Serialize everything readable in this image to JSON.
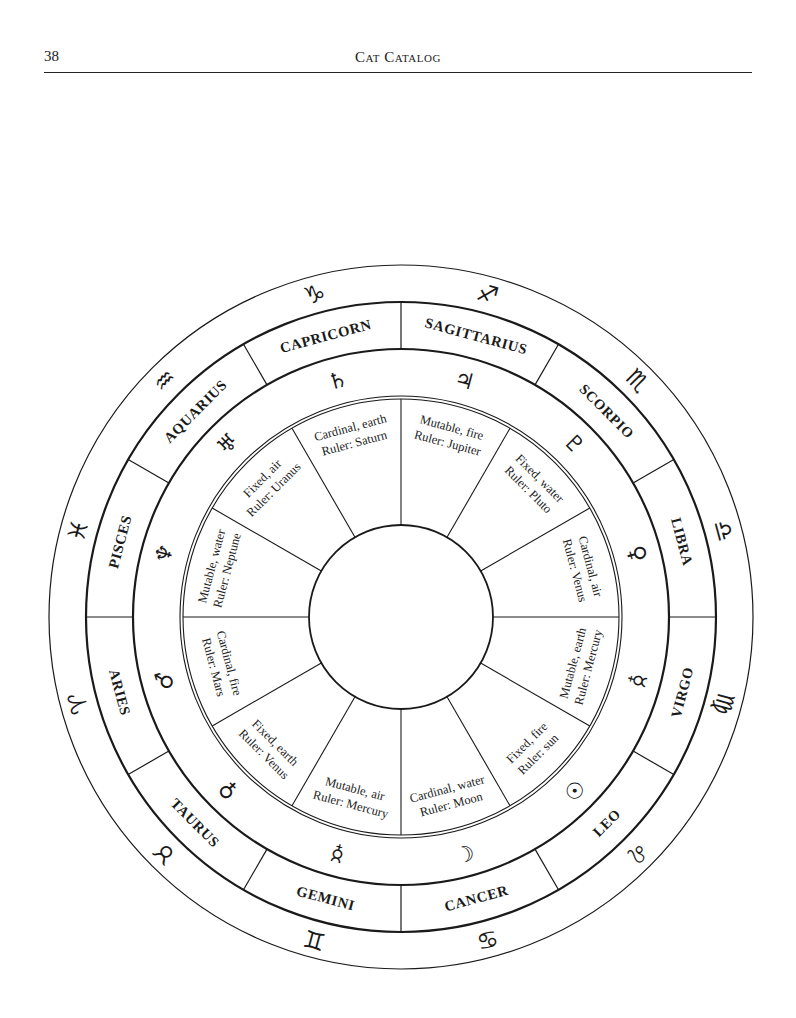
{
  "header": {
    "page_number": "38",
    "running_head": "Cat Catalog"
  },
  "wheel": {
    "center": [
      401,
      617
    ],
    "radii": {
      "outer": 352,
      "sign_band_outer": 315,
      "sign_band_inner": 268,
      "double_outer": 221,
      "double_inner": 218,
      "hub": 92
    },
    "line_color": "#1a1a1a",
    "segments": [
      {
        "sign": "SAGITTARIUS",
        "sign_glyph": "♐",
        "sign_glyph_name": "sagittarius-glyph-icon",
        "planet_glyph": "♃",
        "planet_glyph_name": "jupiter-glyph-icon",
        "quality": "Mutable, fire",
        "ruler": "Ruler: Jupiter",
        "angle": 15
      },
      {
        "sign": "SCORPIO",
        "sign_glyph": "♏",
        "sign_glyph_name": "scorpio-glyph-icon",
        "planet_glyph": "♇",
        "planet_glyph_name": "pluto-glyph-icon",
        "quality": "Fixed, water",
        "ruler": "Ruler: Pluto",
        "angle": 45
      },
      {
        "sign": "LIBRA",
        "sign_glyph": "♎",
        "sign_glyph_name": "libra-glyph-icon",
        "planet_glyph": "♀",
        "planet_glyph_name": "venus-glyph-icon",
        "quality": "Cardinal, air",
        "ruler": "Ruler: Venus",
        "angle": 75
      },
      {
        "sign": "VIRGO",
        "sign_glyph": "♍",
        "sign_glyph_name": "virgo-glyph-icon",
        "planet_glyph": "☿",
        "planet_glyph_name": "mercury-glyph-icon",
        "quality": "Mutable, earth",
        "ruler": "Ruler: Mercury",
        "angle": 105
      },
      {
        "sign": "LEO",
        "sign_glyph": "♌",
        "sign_glyph_name": "leo-glyph-icon",
        "planet_glyph": "☉",
        "planet_glyph_name": "sun-glyph-icon",
        "quality": "Fixed, fire",
        "ruler": "Ruler: sun",
        "angle": 135
      },
      {
        "sign": "CANCER",
        "sign_glyph": "♋",
        "sign_glyph_name": "cancer-glyph-icon",
        "planet_glyph": "☾",
        "planet_glyph_name": "moon-glyph-icon",
        "quality": "Cardinal, water",
        "ruler": "Ruler: Moon",
        "angle": 165
      },
      {
        "sign": "GEMINI",
        "sign_glyph": "♊",
        "sign_glyph_name": "gemini-glyph-icon",
        "planet_glyph": "☿",
        "planet_glyph_name": "mercury-glyph-icon",
        "quality": "Mutable, air",
        "ruler": "Ruler: Mercury",
        "angle": 195
      },
      {
        "sign": "TAURUS",
        "sign_glyph": "♉",
        "sign_glyph_name": "taurus-glyph-icon",
        "planet_glyph": "♀",
        "planet_glyph_name": "venus-glyph-icon",
        "quality": "Fixed, earth",
        "ruler": "Ruler: Venus",
        "angle": 225
      },
      {
        "sign": "ARIES",
        "sign_glyph": "♈",
        "sign_glyph_name": "aries-glyph-icon",
        "planet_glyph": "♂",
        "planet_glyph_name": "mars-glyph-icon",
        "quality": "Cardinal, fire",
        "ruler": "Ruler: Mars",
        "angle": 255
      },
      {
        "sign": "PISCES",
        "sign_glyph": "♓",
        "sign_glyph_name": "pisces-glyph-icon",
        "planet_glyph": "♆",
        "planet_glyph_name": "neptune-glyph-icon",
        "quality": "Mutable, water",
        "ruler": "Ruler: Neptune",
        "angle": 285
      },
      {
        "sign": "AQUARIUS",
        "sign_glyph": "♒",
        "sign_glyph_name": "aquarius-glyph-icon",
        "planet_glyph": "♅",
        "planet_glyph_name": "uranus-glyph-icon",
        "quality": "Fixed, air",
        "ruler": "Ruler: Uranus",
        "angle": 315
      },
      {
        "sign": "CAPRICORN",
        "sign_glyph": "♑",
        "sign_glyph_name": "capricorn-glyph-icon",
        "planet_glyph": "♄",
        "planet_glyph_name": "saturn-glyph-icon",
        "quality": "Cardinal, earth",
        "ruler": "Ruler: Saturn",
        "angle": 345
      }
    ]
  }
}
